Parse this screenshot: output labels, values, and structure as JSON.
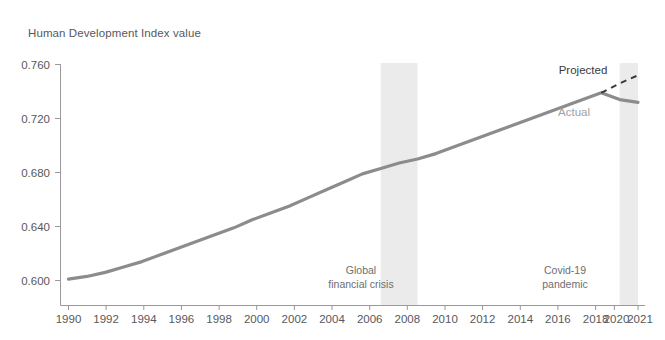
{
  "chart_data": {
    "type": "line",
    "title": "Human Development Index value",
    "xlabel": "",
    "ylabel": "Human Development Index value",
    "ylim": [
      0.59,
      0.765
    ],
    "xlim": [
      1990,
      2021
    ],
    "grid": false,
    "legend_position": "inline-annotation",
    "ytick_labels": [
      "0.760",
      "0.720",
      "0.680",
      "0.640",
      "0.600"
    ],
    "ytick_values": [
      0.76,
      0.72,
      0.68,
      0.64,
      0.6
    ],
    "xtick_labels": [
      "1990",
      "1992",
      "1994",
      "1996",
      "1998",
      "2000",
      "2002",
      "2004",
      "2006",
      "2008",
      "2010",
      "2012",
      "2014",
      "2016",
      "2018",
      "2020",
      "2021"
    ],
    "xtick_values": [
      1990,
      1992,
      1994,
      1996,
      1998,
      2000,
      2002,
      2004,
      2006,
      2008,
      2010,
      2012,
      2014,
      2016,
      2018,
      2020,
      2021
    ],
    "series": [
      {
        "name": "Actual",
        "style": "solid",
        "color": "#8c8c8e",
        "x": [
          1990,
          1991,
          1992,
          1993,
          1994,
          1995,
          1996,
          1997,
          1998,
          1999,
          2000,
          2001,
          2002,
          2003,
          2004,
          2005,
          2006,
          2007,
          2008,
          2009,
          2010,
          2011,
          2012,
          2013,
          2014,
          2015,
          2016,
          2017,
          2018,
          2019,
          2020,
          2021
        ],
        "values": [
          0.601,
          0.603,
          0.606,
          0.61,
          0.614,
          0.619,
          0.624,
          0.629,
          0.634,
          0.639,
          0.645,
          0.65,
          0.655,
          0.661,
          0.667,
          0.673,
          0.679,
          0.683,
          0.687,
          0.69,
          0.694,
          0.699,
          0.704,
          0.709,
          0.714,
          0.719,
          0.724,
          0.729,
          0.734,
          0.739,
          0.734,
          0.732
        ]
      },
      {
        "name": "Projected",
        "style": "dashed",
        "color": "#3a3a3c",
        "x": [
          2019,
          2020,
          2021
        ],
        "values": [
          0.739,
          0.746,
          0.752
        ]
      }
    ],
    "shaded_regions": [
      {
        "label": "Global\nfinancial crisis",
        "label_lines": [
          "Global",
          "financial crisis"
        ],
        "x_start": 2007,
        "x_end": 2009,
        "color": "#ebebeb"
      },
      {
        "label": "Covid-19\npandemic",
        "label_lines": [
          "Covid-19",
          "pandemic"
        ],
        "x_start": 2020,
        "x_end": 2021,
        "color": "#ebebeb"
      }
    ],
    "annotations": [
      {
        "text": "Projected",
        "x": 2019.1,
        "y": 0.757,
        "color": "#3a3a3c"
      },
      {
        "text": "Actual",
        "x": 2018.5,
        "y": 0.727,
        "color": "#a0a0a2"
      },
      {
        "text": "Global",
        "x": 2006.2,
        "y": 0.6075,
        "color": "#6e6e70"
      },
      {
        "text": "financial crisis",
        "x": 2006.2,
        "y": 0.5995,
        "color": "#6e6e70"
      },
      {
        "text": "Covid-19",
        "x": 2018.1,
        "y": 0.6075,
        "color": "#6e6e70"
      },
      {
        "text": "pandemic",
        "x": 2018.1,
        "y": 0.5995,
        "color": "#6e6e70"
      }
    ],
    "colors": {
      "actual_line": "#8c8c8e",
      "projected_line": "#3a3a3c",
      "band": "#ebebeb",
      "axis": "#9a9a9c",
      "text": "#58585a"
    }
  }
}
